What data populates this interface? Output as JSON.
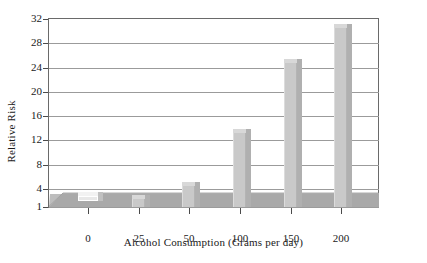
{
  "chart_data": {
    "type": "bar",
    "title": "",
    "xlabel": "Alcohol Consumption (Grams per day)",
    "ylabel": "Relative Risk",
    "categories": [
      "0",
      "25",
      "50",
      "100",
      "150",
      "200"
    ],
    "values": [
      1,
      2.4,
      4.5,
      13.2,
      24.8,
      30.5
    ],
    "yticks": [
      "1",
      "4",
      "8",
      "12",
      "16",
      "20",
      "24",
      "28",
      "32"
    ],
    "ytick_values": [
      1,
      4,
      8,
      12,
      16,
      20,
      24,
      28,
      32
    ],
    "ylim": [
      1,
      32
    ],
    "grid": true,
    "legend": "none",
    "style": "3d-bar",
    "colors": {
      "bar_face": "#c9c9c9",
      "bar_top": "#d8d8d8",
      "bar_side": "#b0b0b0",
      "floor": "#a9a9a9",
      "floor_top": "#bdbdbd",
      "gridline": "#9b9b9b",
      "frame": "#6a6a6a",
      "text": "#1a1a1a",
      "background": "#ffffff"
    }
  },
  "axes": {
    "y": {
      "title": "Relative Risk",
      "ticks": [
        {
          "label": "32",
          "value": 32
        },
        {
          "label": "28",
          "value": 28
        },
        {
          "label": "24",
          "value": 24
        },
        {
          "label": "20",
          "value": 20
        },
        {
          "label": "16",
          "value": 16
        },
        {
          "label": "12",
          "value": 12
        },
        {
          "label": "8",
          "value": 8
        },
        {
          "label": "4",
          "value": 4
        },
        {
          "label": "1",
          "value": 1
        }
      ]
    },
    "x": {
      "title": "Alcohol Consumption (Grams per day)",
      "ticks": [
        {
          "label": "0",
          "value": 0
        },
        {
          "label": "25",
          "value": 25
        },
        {
          "label": "50",
          "value": 50
        },
        {
          "label": "100",
          "value": 100
        },
        {
          "label": "150",
          "value": 150
        },
        {
          "label": "200",
          "value": 200
        }
      ]
    }
  },
  "bars": [
    {
      "category": "0",
      "value": 1
    },
    {
      "category": "25",
      "value": 2.4
    },
    {
      "category": "50",
      "value": 4.5
    },
    {
      "category": "100",
      "value": 13.2
    },
    {
      "category": "150",
      "value": 24.8
    },
    {
      "category": "200",
      "value": 30.5
    }
  ]
}
